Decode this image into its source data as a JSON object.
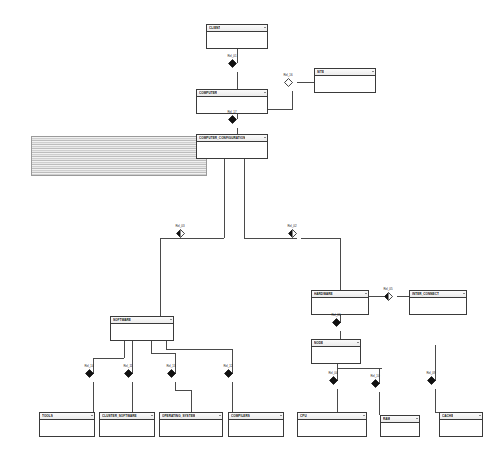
{
  "diagram": {
    "notation": "entity-relationship",
    "background_color": "#ffffff",
    "line_color": "#4a4a4a",
    "entity_border_color": "#3a3a3a"
  },
  "entities": [
    {
      "id": "client",
      "label": "CLIENT",
      "x": 206,
      "y": 24,
      "w": 62,
      "h": 25
    },
    {
      "id": "site",
      "label": "SITE",
      "x": 314,
      "y": 68,
      "w": 62,
      "h": 25
    },
    {
      "id": "computer",
      "label": "COMPUTER",
      "x": 196,
      "y": 89,
      "w": 72,
      "h": 25
    },
    {
      "id": "computer_conf",
      "label": "COMPUTER_CONFIGURATION",
      "x": 196,
      "y": 134,
      "w": 72,
      "h": 25
    },
    {
      "id": "hardware",
      "label": "HARDWARE",
      "x": 311,
      "y": 290,
      "w": 58,
      "h": 25
    },
    {
      "id": "interconnect",
      "label": "INTER_CONNECT",
      "x": 409,
      "y": 290,
      "w": 58,
      "h": 25
    },
    {
      "id": "software",
      "label": "SOFTWARE",
      "x": 110,
      "y": 316,
      "w": 64,
      "h": 25
    },
    {
      "id": "node",
      "label": "NODE",
      "x": 311,
      "y": 339,
      "w": 50,
      "h": 25
    },
    {
      "id": "tools",
      "label": "TOOLS",
      "x": 39,
      "y": 412,
      "w": 56,
      "h": 25
    },
    {
      "id": "cluster_sw",
      "label": "CLUSTER_SOFTWARE",
      "x": 99,
      "y": 412,
      "w": 56,
      "h": 25
    },
    {
      "id": "operating_sys",
      "label": "OPERATING_SYSTEM",
      "x": 159,
      "y": 412,
      "w": 64,
      "h": 25
    },
    {
      "id": "compilers",
      "label": "COMPILERS",
      "x": 228,
      "y": 412,
      "w": 56,
      "h": 25
    },
    {
      "id": "cpu",
      "label": "CPU",
      "x": 297,
      "y": 412,
      "w": 70,
      "h": 25
    },
    {
      "id": "ram",
      "label": "RAM",
      "x": 380,
      "y": 415,
      "w": 40,
      "h": 22
    },
    {
      "id": "cache",
      "label": "CACHE",
      "x": 439,
      "y": 412,
      "w": 44,
      "h": 25
    }
  ],
  "attribute_panel": {
    "id": "computer_configuration_attributes",
    "x": 31,
    "y": 136,
    "w": 176,
    "h": 40,
    "description": "expanded attribute list"
  },
  "relationships": [
    {
      "id": "rel_01",
      "label": "Rel_01",
      "x": 232,
      "y": 63,
      "style": "filled",
      "from": "client",
      "to": "computer"
    },
    {
      "id": "rel_16",
      "label": "Rel_16",
      "x": 288,
      "y": 82,
      "style": "hollow",
      "from": "computer",
      "to": "site"
    },
    {
      "id": "rel_17",
      "label": "Rel_17",
      "x": 232,
      "y": 119,
      "style": "filled",
      "from": "computer",
      "to": "computer_conf"
    },
    {
      "id": "rel_03",
      "label": "Rel_03",
      "x": 180,
      "y": 233,
      "style": "half",
      "from": "computer_conf",
      "to": "software"
    },
    {
      "id": "rel_02",
      "label": "Rel_02",
      "x": 292,
      "y": 233,
      "style": "half",
      "from": "computer_conf",
      "to": "hardware"
    },
    {
      "id": "rel_05",
      "label": "Rel_05",
      "x": 388,
      "y": 296,
      "style": "half",
      "from": "hardware",
      "to": "interconnect"
    },
    {
      "id": "rel_06",
      "label": "Rel_06",
      "x": 336,
      "y": 322,
      "style": "filled",
      "from": "hardware",
      "to": "node"
    },
    {
      "id": "rel_14",
      "label": "Rel_14",
      "x": 89,
      "y": 373,
      "style": "filled",
      "from": "software",
      "to": "tools"
    },
    {
      "id": "rel_11",
      "label": "Rel_11",
      "x": 128,
      "y": 373,
      "style": "filled",
      "from": "software",
      "to": "cluster_sw"
    },
    {
      "id": "rel_13",
      "label": "Rel_13",
      "x": 171,
      "y": 373,
      "style": "filled",
      "from": "software",
      "to": "operating_sys"
    },
    {
      "id": "rel_12",
      "label": "Rel_12",
      "x": 228,
      "y": 373,
      "style": "filled",
      "from": "software",
      "to": "compilers"
    },
    {
      "id": "rel_04",
      "label": "Rel_04",
      "x": 333,
      "y": 380,
      "style": "filled",
      "from": "node",
      "to": "cpu"
    },
    {
      "id": "rel_10",
      "label": "Rel_10",
      "x": 375,
      "y": 383,
      "style": "filled",
      "from": "node",
      "to": "ram"
    },
    {
      "id": "rel_09",
      "label": "Rel_09",
      "x": 431,
      "y": 380,
      "style": "filled",
      "from": "node",
      "to": "cache"
    }
  ],
  "connectors": [
    {
      "o": "v",
      "x": 237,
      "y": 49,
      "len": 14
    },
    {
      "o": "v",
      "x": 237,
      "y": 72,
      "len": 17
    },
    {
      "o": "v",
      "x": 237,
      "y": 114,
      "len": 5
    },
    {
      "o": "v",
      "x": 237,
      "y": 128,
      "len": 6
    },
    {
      "o": "h",
      "x": 268,
      "y": 109,
      "len": 25
    },
    {
      "o": "v",
      "x": 292,
      "y": 91,
      "len": 18
    },
    {
      "o": "h",
      "x": 297,
      "y": 82,
      "len": 17
    },
    {
      "o": "v",
      "x": 224,
      "y": 159,
      "len": 79
    },
    {
      "o": "h",
      "x": 160,
      "y": 238,
      "len": 64
    },
    {
      "o": "v",
      "x": 160,
      "y": 238,
      "len": 78
    },
    {
      "o": "h",
      "x": 160,
      "y": 316,
      "len": 14
    },
    {
      "o": "h",
      "x": 189,
      "y": 238,
      "len": 14
    },
    {
      "o": "v",
      "x": 244,
      "y": 159,
      "len": 79
    },
    {
      "o": "h",
      "x": 244,
      "y": 238,
      "len": 53
    },
    {
      "o": "v",
      "x": 340,
      "y": 238,
      "len": 52
    },
    {
      "o": "h",
      "x": 301,
      "y": 238,
      "len": 39
    },
    {
      "o": "h",
      "x": 369,
      "y": 296,
      "len": 19
    },
    {
      "o": "h",
      "x": 397,
      "y": 296,
      "len": 12
    },
    {
      "o": "v",
      "x": 340,
      "y": 315,
      "len": 8
    },
    {
      "o": "v",
      "x": 340,
      "y": 331,
      "len": 8
    },
    {
      "o": "v",
      "x": 124,
      "y": 341,
      "len": 17
    },
    {
      "o": "h",
      "x": 93,
      "y": 358,
      "len": 31
    },
    {
      "o": "v",
      "x": 93,
      "y": 358,
      "len": 16
    },
    {
      "o": "v",
      "x": 93,
      "y": 382,
      "len": 30
    },
    {
      "o": "v",
      "x": 132,
      "y": 341,
      "len": 17
    },
    {
      "o": "h",
      "x": 132,
      "y": 358,
      "len": 0
    },
    {
      "o": "v",
      "x": 132,
      "y": 358,
      "len": 16
    },
    {
      "o": "v",
      "x": 132,
      "y": 382,
      "len": 30
    },
    {
      "o": "v",
      "x": 151,
      "y": 341,
      "len": 12
    },
    {
      "o": "h",
      "x": 151,
      "y": 353,
      "len": 24
    },
    {
      "o": "v",
      "x": 175,
      "y": 353,
      "len": 21
    },
    {
      "o": "v",
      "x": 175,
      "y": 382,
      "len": 8
    },
    {
      "o": "h",
      "x": 175,
      "y": 390,
      "len": 16
    },
    {
      "o": "v",
      "x": 191,
      "y": 390,
      "len": 22
    },
    {
      "o": "v",
      "x": 166,
      "y": 341,
      "len": 8
    },
    {
      "o": "h",
      "x": 166,
      "y": 349,
      "len": 66
    },
    {
      "o": "v",
      "x": 232,
      "y": 349,
      "len": 25
    },
    {
      "o": "v",
      "x": 232,
      "y": 382,
      "len": 30
    },
    {
      "o": "v",
      "x": 337,
      "y": 364,
      "len": 17
    },
    {
      "o": "v",
      "x": 337,
      "y": 389,
      "len": 23
    },
    {
      "o": "h",
      "x": 337,
      "y": 368,
      "len": 45
    },
    {
      "o": "v",
      "x": 379,
      "y": 368,
      "len": 16
    },
    {
      "o": "v",
      "x": 379,
      "y": 392,
      "len": 23
    },
    {
      "o": "v",
      "x": 435,
      "y": 345,
      "len": 36
    },
    {
      "o": "v",
      "x": 435,
      "y": 389,
      "len": 23
    },
    {
      "o": "h",
      "x": 435,
      "y": 412,
      "len": 6
    }
  ]
}
